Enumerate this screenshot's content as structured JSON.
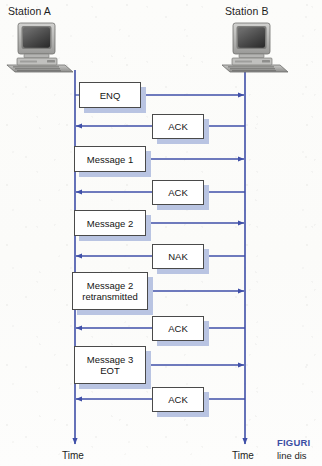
{
  "figure": {
    "type": "sequence-timing-diagram",
    "background_color": "#fdfdfb",
    "line_color": "#3f4fa8",
    "box_border_color": "#4a4a4a",
    "box_fill_color": "#ffffff",
    "shadow_color": "#b9c4e2",
    "text_color": "#141414"
  },
  "stations": {
    "left": {
      "label": "Station A",
      "icon": "desktop-computer-icon",
      "timeline_x": 75,
      "time_label": "Time"
    },
    "right": {
      "label": "Station B",
      "icon": "desktop-computer-icon",
      "timeline_x": 245,
      "time_label": "Time"
    }
  },
  "messages": [
    {
      "id": "enq",
      "label": "ENQ",
      "lines": [
        "ENQ"
      ],
      "direction": "right",
      "y": 95,
      "box_cx": 110,
      "box_w": 62,
      "box_h": 26
    },
    {
      "id": "ack-1",
      "label": "ACK",
      "lines": [
        "ACK"
      ],
      "direction": "left",
      "y": 126,
      "box_cx": 178,
      "box_w": 52,
      "box_h": 25
    },
    {
      "id": "message-1",
      "label": "Message 1",
      "lines": [
        "Message 1"
      ],
      "direction": "right",
      "y": 159,
      "box_cx": 110,
      "box_w": 72,
      "box_h": 26
    },
    {
      "id": "ack-2",
      "label": "ACK",
      "lines": [
        "ACK"
      ],
      "direction": "left",
      "y": 192,
      "box_cx": 178,
      "box_w": 52,
      "box_h": 25
    },
    {
      "id": "message-2",
      "label": "Message 2",
      "lines": [
        "Message 2"
      ],
      "direction": "right",
      "y": 223,
      "box_cx": 110,
      "box_w": 72,
      "box_h": 26
    },
    {
      "id": "nak",
      "label": "NAK",
      "lines": [
        "NAK"
      ],
      "direction": "left",
      "y": 256,
      "box_cx": 178,
      "box_w": 52,
      "box_h": 25
    },
    {
      "id": "message-2-rtx",
      "label": "Message 2 retransmitted",
      "lines": [
        "Message 2",
        "retransmitted"
      ],
      "direction": "right",
      "y": 291,
      "box_cx": 110,
      "box_w": 76,
      "box_h": 38
    },
    {
      "id": "ack-3",
      "label": "ACK",
      "lines": [
        "ACK"
      ],
      "direction": "left",
      "y": 328,
      "box_cx": 178,
      "box_w": 52,
      "box_h": 25
    },
    {
      "id": "message-3-eot",
      "label": "Message 3 EOT",
      "lines": [
        "Message 3",
        "EOT"
      ],
      "direction": "right",
      "y": 365,
      "box_cx": 110,
      "box_w": 72,
      "box_h": 38
    },
    {
      "id": "ack-4",
      "label": "ACK",
      "lines": [
        "ACK"
      ],
      "direction": "left",
      "y": 399,
      "box_cx": 178,
      "box_w": 52,
      "box_h": 25
    }
  ],
  "caption": {
    "figure_word": "FIGURI",
    "body_text": "line dis"
  }
}
